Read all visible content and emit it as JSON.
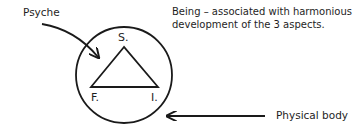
{
  "diagram": {
    "labels": {
      "psyche": "Psyche",
      "being_line1": "Being – associated with harmonious",
      "being_line2": "development of the 3 aspects.",
      "physical_body": "Physical body"
    },
    "triangle_vertices": {
      "top": "S.",
      "bottom_left": "F.",
      "bottom_right": "I."
    },
    "shapes": {
      "circle": {
        "cx": 124,
        "cy": 75,
        "r": 48
      },
      "triangle": {
        "apex": [
          124,
          47
        ],
        "left": [
          91,
          87
        ],
        "right": [
          158,
          87
        ]
      }
    },
    "colors": {
      "stroke": "#1a1a1a",
      "text": "#1e1e1e",
      "background": "#ffffff"
    }
  }
}
